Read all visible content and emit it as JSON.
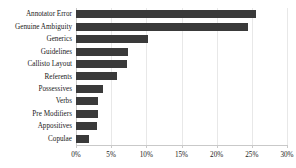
{
  "chart_data": {
    "type": "bar",
    "orientation": "horizontal",
    "title": "",
    "subtitle": "",
    "xlabel": "",
    "ylabel": "",
    "categories": [
      "Annotator Error",
      "Genuine Ambiguity",
      "Generics",
      "Guidelines",
      "Callisto Layout",
      "Referents",
      "Possessives",
      "Verbs",
      "Pre Modifiers",
      "Appositives",
      "Copulae"
    ],
    "values": [
      25.6,
      24.5,
      10.2,
      7.4,
      7.3,
      5.9,
      3.8,
      3.1,
      3.1,
      3.0,
      1.8
    ],
    "value_unit": "%",
    "xlim": [
      0,
      30
    ],
    "xticks": [
      0,
      5,
      10,
      15,
      20,
      25,
      30
    ],
    "xtick_labels": [
      "0%",
      "5%",
      "10%",
      "15%",
      "20%",
      "25%",
      "30%"
    ],
    "grid": true,
    "grid_axis": "x",
    "legend": false,
    "legend_position": "none",
    "series": [
      {
        "name": "",
        "values": [
          25.6,
          24.5,
          10.2,
          7.4,
          7.3,
          5.9,
          3.8,
          3.1,
          3.1,
          3.0,
          1.8
        ]
      }
    ]
  },
  "colors": {
    "bar": "#3a3a3a",
    "gridline": "#e8e8e8",
    "axis": "#c9c9c9",
    "background": "#ffffff",
    "text": "#1a1a1a"
  },
  "accessible": {
    "chart_description": "Horizontal bar chart of annotation disagreement causes by percentage"
  }
}
